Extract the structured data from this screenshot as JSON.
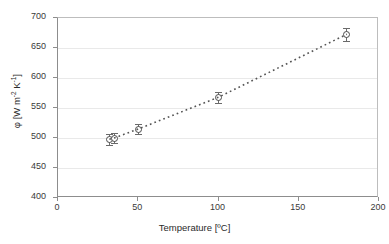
{
  "chart_data": {
    "type": "scatter",
    "title": "",
    "xlabel": "Temperature [ºC]",
    "ylabel": "φ [W m-2 K-1]",
    "ylabel_parts": {
      "symbol": "φ",
      "open": " [W m",
      "sup1": "-2",
      "mid": " K",
      "sup2": "-1",
      "close": "]"
    },
    "xlim": [
      0,
      200
    ],
    "ylim": [
      400,
      700
    ],
    "xticks": [
      0,
      50,
      100,
      150,
      200
    ],
    "yticks": [
      400,
      450,
      500,
      550,
      600,
      650,
      700
    ],
    "grid": "horizontal",
    "legend": "none",
    "marker_style": "open-circle",
    "trendline": {
      "style": "dotted",
      "color": "#555555",
      "from_x": 33,
      "to_x": 180
    },
    "x": [
      32,
      35,
      50,
      100,
      180
    ],
    "y": [
      498,
      500,
      515,
      568,
      673
    ],
    "yerr": [
      9,
      9,
      9,
      9,
      11
    ],
    "points": [
      {
        "x": 32,
        "y": 498,
        "yerr": 9
      },
      {
        "x": 35,
        "y": 500,
        "yerr": 9
      },
      {
        "x": 50,
        "y": 515,
        "yerr": 9
      },
      {
        "x": 100,
        "y": 568,
        "yerr": 9
      },
      {
        "x": 180,
        "y": 673,
        "yerr": 11
      }
    ]
  },
  "colors": {
    "marker_edge": "#4a4a4a",
    "errorbar": "#6a6a6a",
    "grid": "#e9e9e9",
    "axis": "#8d8d8d",
    "text": "#2b2b2b",
    "background": "#ffffff"
  }
}
